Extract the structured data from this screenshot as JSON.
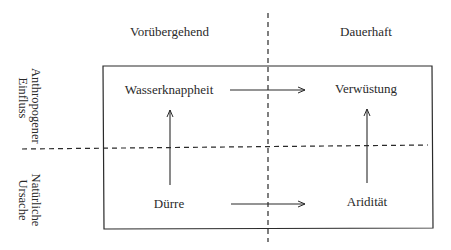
{
  "columns": {
    "left": "Vorübergehend",
    "right": "Dauerhaft"
  },
  "rows": {
    "top": [
      "Anthropogener",
      "Einfluss"
    ],
    "bottom": [
      "Natürliche",
      "Ursache"
    ]
  },
  "nodes": {
    "top_left": "Wasserknappheit",
    "top_right": "Verwüstung",
    "bottom_left": "Dürre",
    "bottom_right": "Aridität"
  },
  "arrows": [
    {
      "from": "Wasserknappheit",
      "to": "Verwüstung"
    },
    {
      "from": "Dürre",
      "to": "Aridität"
    },
    {
      "from": "Dürre",
      "to": "Wasserknappheit"
    },
    {
      "from": "Aridität",
      "to": "Verwüstung"
    }
  ],
  "colors": {
    "line": "#2a2a2a",
    "text": "#2a2a2a"
  }
}
